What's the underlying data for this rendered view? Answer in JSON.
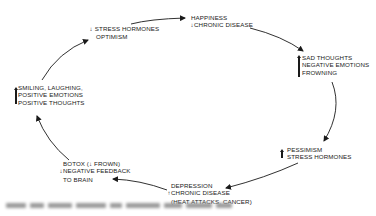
{
  "diagram": {
    "type": "cycle",
    "nodes": [
      {
        "id": "smiling",
        "indicator": "up",
        "lines": [
          "SMILING, LAUGHING,",
          "POSITIVE EMOTIONS",
          "POSITIVE THOUGHTS"
        ]
      },
      {
        "id": "stress-down",
        "indicator": "down",
        "lines": [
          "STRESS HORMONES",
          "OPTIMISM"
        ]
      },
      {
        "id": "happiness",
        "lines": [
          "HAPPINESS",
          "CHRONIC DISEASE"
        ],
        "indicators": [
          "",
          "down"
        ]
      },
      {
        "id": "sad",
        "indicator": "up",
        "lines": [
          "SAD THOUGHTS",
          "NEGATIVE EMOTIONS",
          "FROWNING"
        ]
      },
      {
        "id": "pessimism",
        "indicator": "up",
        "lines": [
          "PESSIMISM",
          "STRESS HORMONES"
        ]
      },
      {
        "id": "depression",
        "lines": [
          "DEPRESSION",
          "CHRONIC DISEASE",
          "(HEAT ATTACKS, CANCER)"
        ],
        "indicators": [
          "",
          "up",
          ""
        ]
      },
      {
        "id": "botox",
        "lines": [
          "BOTOX (↓ FROWN)",
          "NEGATIVE FEEDBACK",
          "TO BRAIN"
        ],
        "indicators": [
          "",
          "down",
          ""
        ]
      }
    ],
    "edges": [
      [
        "smiling",
        "stress-down"
      ],
      [
        "stress-down",
        "happiness"
      ],
      [
        "happiness",
        "sad"
      ],
      [
        "sad",
        "pessimism"
      ],
      [
        "pessimism",
        "depression"
      ],
      [
        "depression",
        "botox"
      ],
      [
        "botox",
        "smiling"
      ]
    ],
    "glyphs": {
      "up": "↑",
      "down": "↓"
    },
    "caption": "(blurred, unreadable)"
  }
}
